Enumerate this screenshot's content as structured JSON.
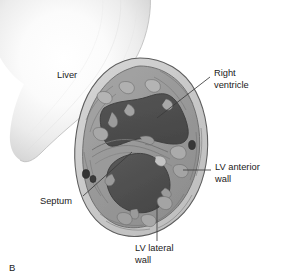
{
  "figure": {
    "type": "anatomical-illustration",
    "panel_letter": "B",
    "background_color": "#ffffff"
  },
  "labels": {
    "liver": {
      "text": "Liver",
      "lines": [
        "Liver"
      ],
      "has_leader_line": false
    },
    "right_ventricle": {
      "text": "Right ventricle",
      "lines": [
        "Right",
        "ventricle"
      ],
      "has_leader_line": true
    },
    "lv_anterior_wall": {
      "text": "LV anterior wall",
      "lines": [
        "LV anterior",
        "wall"
      ],
      "has_leader_line": true
    },
    "lv_lateral_wall": {
      "text": "LV lateral wall",
      "lines": [
        "LV lateral",
        "wall"
      ],
      "has_leader_line": true
    },
    "septum": {
      "text": "Septum",
      "lines": [
        "Septum"
      ],
      "has_leader_line": true
    }
  },
  "colors": {
    "text": "#1a1a1a",
    "leader_line": "#3b3b3b",
    "cavity_dark": "#4f4f4f",
    "myocardium_mid": "#9c9c9c",
    "myocardium_light": "#c3c3c3",
    "epicardium_rim": "#cfcfcf",
    "outline": "#5a5a5a",
    "liver_light": "#fdfdfd",
    "liver_edge": "#c8c8c8",
    "vessel_dot": "#3a3a3a"
  },
  "structures": [
    {
      "name": "liver",
      "label": "Liver",
      "shading": "gradient-soft"
    },
    {
      "name": "right-ventricle-cavity",
      "label": "Right ventricle",
      "shading": "dark-fill"
    },
    {
      "name": "left-ventricle-cavity",
      "label": "LV cavity",
      "shading": "dark-fill"
    },
    {
      "name": "interventricular-septum",
      "label": "Septum",
      "shading": "mid-gray"
    },
    {
      "name": "lv-anterior-wall",
      "label": "LV anterior wall",
      "shading": "mid-gray"
    },
    {
      "name": "lv-lateral-wall",
      "label": "LV lateral wall",
      "shading": "mid-gray"
    },
    {
      "name": "epicardium",
      "label": "Epicardial rim",
      "shading": "light-gray"
    }
  ]
}
